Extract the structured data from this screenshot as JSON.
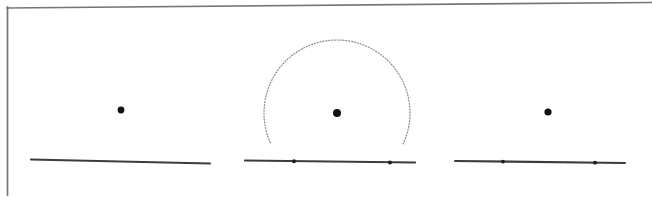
{
  "figure": {
    "caption": "",
    "width": 652,
    "height": 196,
    "background_color": "#ffffff",
    "ink_color": "#3c3c3c",
    "frame_color": "#767676",
    "arc_color": "#8e8e8e",
    "point_color": "#111111"
  },
  "frame": {
    "name": "page-border",
    "top_edge": {
      "x1": 7,
      "y1": 8,
      "x2": 652,
      "y2": 2.5
    },
    "left_edge": {
      "x1": 7,
      "y1": 8,
      "x2": 7,
      "y2": 196
    }
  },
  "panels": [
    {
      "id": "panel-1",
      "label": "Step 1 — given point and line",
      "point": {
        "name": "P",
        "cx": 121,
        "cy": 110,
        "r": 3.4
      },
      "line": {
        "x1": 31,
        "y1": 159.5,
        "x2": 210,
        "y2": 163.5
      },
      "arc": null,
      "marks": []
    },
    {
      "id": "panel-2",
      "label": "Step 2 — arc centred at the point cuts the line twice",
      "point": {
        "name": "P",
        "cx": 337,
        "cy": 113,
        "r": 4.0
      },
      "line": {
        "x1": 245,
        "y1": 160.5,
        "x2": 415,
        "y2": 162.5
      },
      "arc": {
        "cx": 337,
        "cy": 113,
        "r": 73,
        "start_angle_deg": 25,
        "end_angle_deg": 155,
        "style": "dotted"
      },
      "marks": [
        {
          "name": "A",
          "cx": 294,
          "cy": 161.3,
          "r": 2.0
        },
        {
          "name": "B",
          "cx": 390,
          "cy": 162.4,
          "r": 2.0
        }
      ]
    },
    {
      "id": "panel-3",
      "label": "Step 3 — the two intersection points remain marked",
      "point": {
        "name": "P",
        "cx": 548,
        "cy": 112,
        "r": 3.6
      },
      "line": {
        "x1": 455,
        "y1": 161,
        "x2": 625,
        "y2": 163
      },
      "arc": null,
      "marks": [
        {
          "name": "A",
          "cx": 503,
          "cy": 161.6,
          "r": 1.9
        },
        {
          "name": "B",
          "cx": 595,
          "cy": 162.7,
          "r": 1.9
        }
      ]
    }
  ],
  "chart_data": {
    "type": "scatter",
    "xlabel": "",
    "ylabel": "",
    "xlim": [
      0,
      652
    ],
    "ylim": [
      196,
      0
    ],
    "grid": false,
    "legend": "none",
    "series": [
      {
        "name": "given-points",
        "marker": "filled-circle",
        "x": [
          121,
          337,
          548
        ],
        "y": [
          110,
          113,
          112
        ]
      },
      {
        "name": "intersection-points",
        "marker": "small-filled-circle",
        "x": [
          294,
          390,
          503,
          595
        ],
        "y": [
          161.3,
          162.4,
          161.6,
          162.7
        ]
      }
    ],
    "annotations": [
      {
        "type": "line",
        "x": [
          31,
          210
        ],
        "y": [
          159.5,
          163.5
        ]
      },
      {
        "type": "line",
        "x": [
          245,
          415
        ],
        "y": [
          160.5,
          162.5
        ]
      },
      {
        "type": "line",
        "x": [
          455,
          625
        ],
        "y": [
          161,
          163
        ]
      },
      {
        "type": "arc",
        "center": [
          337,
          113
        ],
        "radius": 73,
        "angles_deg": [
          25,
          155
        ],
        "style": "dotted"
      },
      {
        "type": "line",
        "x": [
          7,
          652
        ],
        "y": [
          8,
          2.5
        ],
        "style": "frame"
      },
      {
        "type": "line",
        "x": [
          7,
          7
        ],
        "y": [
          8,
          196
        ],
        "style": "frame"
      }
    ]
  }
}
